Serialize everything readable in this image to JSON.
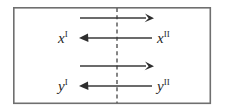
{
  "figure": {
    "name": "two-region-exchange-diagram",
    "background_color": "#ffffff",
    "frame": {
      "stroke_color": "#6f6f6f",
      "stroke_width": 1.6,
      "x": 13,
      "y": 7,
      "width": 198,
      "height": 97
    },
    "interface": {
      "label": "dashed-divider",
      "stroke_color": "#5d5d5d",
      "dash_pattern": "4 3.2",
      "x": 117,
      "y_top": 7,
      "y_bottom": 104
    },
    "arrow_color": "#3a3a3a",
    "arrows": [
      {
        "id": "x-forward",
        "direction": "right",
        "row": "x",
        "y": 18,
        "x_start": 80,
        "x_end": 153
      },
      {
        "id": "x-backward",
        "direction": "left",
        "row": "x",
        "y": 38,
        "x_start": 80,
        "x_end": 153
      },
      {
        "id": "y-forward",
        "direction": "right",
        "row": "y",
        "y": 66,
        "x_start": 80,
        "x_end": 153
      },
      {
        "id": "y-backward",
        "direction": "left",
        "row": "y",
        "y": 86,
        "x_start": 80,
        "x_end": 153
      }
    ],
    "labels": [
      {
        "id": "x-region-one",
        "base": "x",
        "superscript": "I",
        "x": 60,
        "y": 43,
        "side": "left",
        "row": "x"
      },
      {
        "id": "x-region-two",
        "base": "x",
        "superscript": "II",
        "x": 158,
        "y": 43,
        "side": "right",
        "row": "x"
      },
      {
        "id": "y-region-one",
        "base": "y",
        "superscript": "I",
        "x": 60,
        "y": 91,
        "side": "left",
        "row": "y"
      },
      {
        "id": "y-region-two",
        "base": "y",
        "superscript": "II",
        "x": 158,
        "y": 91,
        "side": "right",
        "row": "y"
      }
    ]
  }
}
